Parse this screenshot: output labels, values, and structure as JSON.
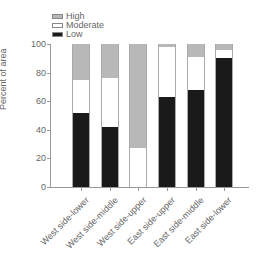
{
  "chart_data": {
    "type": "bar",
    "stacked": true,
    "title": "",
    "xlabel": "",
    "ylabel": "Percent of area",
    "ylim": [
      0,
      100
    ],
    "yticks": [
      0,
      20,
      40,
      60,
      80,
      100
    ],
    "categories": [
      "West side-lower",
      "West side-middle",
      "West side-upper",
      "East side-upper",
      "East side-middle",
      "East side-lower"
    ],
    "series": [
      {
        "name": "Low",
        "color": "#1a1a1a",
        "values": [
          52,
          42,
          0,
          63,
          68,
          90
        ]
      },
      {
        "name": "Moderate",
        "color": "#ffffff",
        "values": [
          23,
          34,
          27,
          35,
          23,
          6
        ]
      },
      {
        "name": "High",
        "color": "#b8b8b8",
        "values": [
          25,
          24,
          73,
          2,
          9,
          4
        ]
      }
    ],
    "legend": {
      "position": "top-left",
      "entries": [
        "High",
        "Moderate",
        "Low"
      ]
    },
    "grid": false
  }
}
